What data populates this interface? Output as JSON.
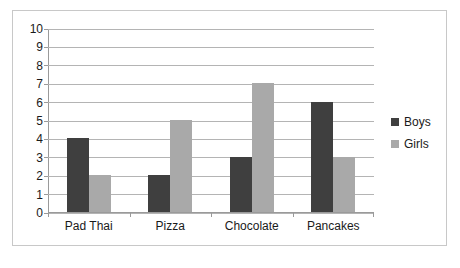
{
  "chart_data": {
    "type": "bar",
    "title": "",
    "subtitle": "",
    "xlabel": "",
    "ylabel": "",
    "categories": [
      "Pad Thai",
      "Pizza",
      "Chocolate",
      "Pancakes"
    ],
    "series": [
      {
        "name": "Boys",
        "color": "#3f3f3f",
        "values": [
          4,
          2,
          3,
          6
        ]
      },
      {
        "name": "Girls",
        "color": "#a9a9a9",
        "values": [
          2,
          5,
          7,
          3
        ]
      }
    ],
    "ylim": [
      0,
      10
    ],
    "ytick_step": 1,
    "ytick_labels": [
      "10",
      "9",
      "8",
      "7",
      "6",
      "5",
      "4",
      "3",
      "2",
      "1",
      "0"
    ],
    "grid": true,
    "legend_position": "right",
    "legend_entries": [
      "Boys",
      "Girls"
    ],
    "annotations": []
  },
  "colors": {
    "boys": "#3f3f3f",
    "girls": "#a9a9a9",
    "gridline": "#b4b4b4",
    "axis": "#9a9a9a",
    "frame": "#c8c8c8",
    "background": "#ffffff",
    "text": "#1a1a1a"
  }
}
